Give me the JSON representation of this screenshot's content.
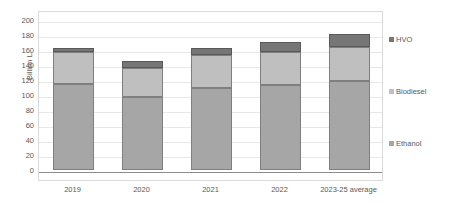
{
  "chart_data": {
    "type": "bar",
    "subtype": "stacked-column",
    "title": "",
    "xlabel": "",
    "ylabel": "Billion L",
    "ylim": [
      0,
      200
    ],
    "ytick_step": 20,
    "yticks": [
      200,
      180,
      160,
      140,
      120,
      100,
      80,
      60,
      40,
      20,
      0
    ],
    "grid": true,
    "grid_axis": "y",
    "legend_position": "right",
    "categories": [
      "2019",
      "2020",
      "2021",
      "2022",
      "2023-25 average"
    ],
    "series": [
      {
        "name": "Ethanol",
        "color": "#a6a6a6",
        "values": [
          115,
          98,
          109,
          114,
          119
        ]
      },
      {
        "name": "Biodiesel",
        "color": "#bfbfbf",
        "values": [
          42,
          38,
          44,
          44,
          45
        ]
      },
      {
        "name": "HVO",
        "color": "#767676",
        "values": [
          6,
          9,
          10,
          13,
          18
        ]
      }
    ],
    "stack_totals": [
      163,
      145,
      163,
      171,
      182
    ],
    "legend_order_top_to_bottom": [
      "HVO",
      "Biodiesel",
      "Ethanol"
    ]
  },
  "axis": {
    "y_title": "Billion L"
  },
  "legend": {
    "items": [
      {
        "label": "HVO",
        "color": "#767676",
        "marker": "square-swatch-icon"
      },
      {
        "label": "Biodiesel",
        "color": "#bfbfbf",
        "marker": "square-swatch-icon"
      },
      {
        "label": "Ethanol",
        "color": "#a6a6a6",
        "marker": "square-swatch-icon"
      }
    ]
  }
}
